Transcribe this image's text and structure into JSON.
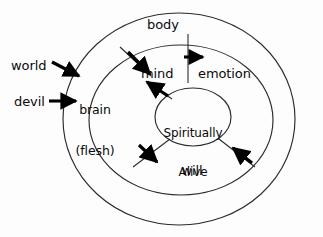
{
  "diagram": {
    "colors": {
      "background": "#fdfdfd",
      "stroke": "#2b2b2b",
      "text": "#0a0a0a",
      "arrow": "#000000"
    },
    "rings": [
      {
        "name": "outer-ring",
        "label": "body"
      },
      {
        "name": "middle-ring",
        "label": "soul"
      },
      {
        "name": "inner-ring",
        "label": "Spiritually Alive"
      }
    ],
    "labels": {
      "world": "world",
      "devil": "devil",
      "brain_line1": "brain",
      "brain_line2": "(flesh)",
      "body": "body",
      "mind": "mind",
      "emotion": "emotion",
      "center_line1": "Spiritually",
      "center_line2": "Alive",
      "will": "will"
    },
    "arrows": [
      {
        "name": "world-arrow",
        "from": "world",
        "to": "brain",
        "direction": "down-right"
      },
      {
        "name": "devil-arrow",
        "from": "devil",
        "to": "brain",
        "direction": "right"
      },
      {
        "name": "body-to-mind-arrow",
        "from": "body",
        "to": "mind",
        "direction": "down-right"
      },
      {
        "name": "body-to-emotion-arrow",
        "from": "body",
        "to": "emotion",
        "direction": "right"
      },
      {
        "name": "center-to-mind-arrow",
        "from": "Spiritually Alive",
        "to": "mind",
        "direction": "up-left"
      },
      {
        "name": "center-to-will-arrow",
        "from": "Spiritually Alive",
        "to": "will",
        "direction": "down-right"
      },
      {
        "name": "body-to-will-arrow",
        "from": "body",
        "to": "will",
        "direction": "up-left"
      }
    ]
  }
}
